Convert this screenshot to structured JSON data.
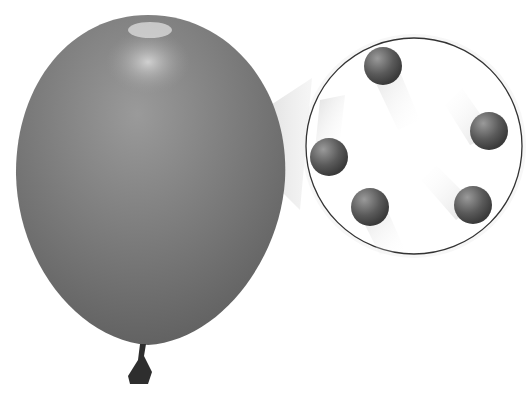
{
  "illustration": {
    "subject": "balloon with magnified view of gas particles",
    "balloon_color": "#7a7a7a",
    "magnifier_border": "#333333",
    "particle_count": 5,
    "particles": [
      {
        "cx": 383,
        "cy": 66
      },
      {
        "cx": 489,
        "cy": 131
      },
      {
        "cx": 329,
        "cy": 157
      },
      {
        "cx": 370,
        "cy": 207
      },
      {
        "cx": 473,
        "cy": 205
      }
    ]
  }
}
